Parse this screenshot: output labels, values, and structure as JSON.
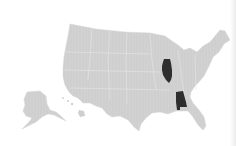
{
  "map": {
    "type": "choropleth",
    "region": "United States",
    "colors": {
      "default_state": "#cfcfcf",
      "state_border": "#e6e6e6",
      "highlighted_state": "#2e2e2e",
      "background": "#ffffff"
    },
    "highlighted_states": [
      "Illinois",
      "Alabama"
    ]
  }
}
